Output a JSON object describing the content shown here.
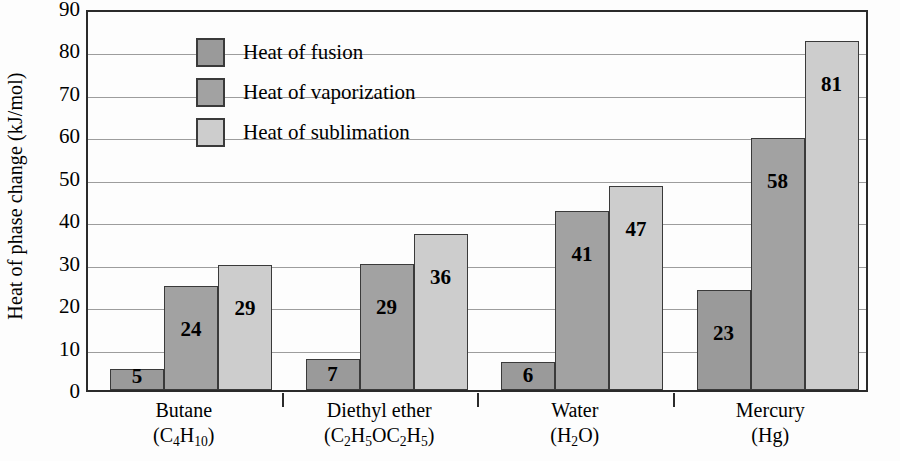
{
  "chart_data": {
    "type": "bar",
    "title": "",
    "xlabel": "",
    "ylabel": "Heat of phase change (kJ/mol)",
    "ylim": [
      0,
      90
    ],
    "ytick_step": 10,
    "yticks": [
      90,
      80,
      70,
      60,
      50,
      40,
      30,
      20,
      10,
      0
    ],
    "grid": true,
    "legend_position": "inside-top-left",
    "categories": [
      "Butane",
      "Diethyl ether",
      "Water",
      "Mercury"
    ],
    "category_formulas": [
      "(C4H10)",
      "(C2H5OC2H5)",
      "(H2O)",
      "(Hg)"
    ],
    "series": [
      {
        "name": "Heat of fusion",
        "color": "#9a9a9a",
        "values": [
          5,
          7,
          6,
          23
        ],
        "bar_tops": [
          5.0,
          7.3,
          6.7,
          23.6
        ],
        "labels": [
          "5",
          "7",
          "6",
          "23"
        ]
      },
      {
        "name": "Heat of vaporization",
        "color": "#a2a2a2",
        "values": [
          24,
          29,
          41,
          58
        ],
        "bar_tops": [
          24.4,
          29.6,
          42.1,
          59.4
        ],
        "labels": [
          "24",
          "29",
          "41",
          "58"
        ]
      },
      {
        "name": "Heat of sublimation",
        "color": "#cdcdcd",
        "values": [
          29,
          36,
          47,
          81
        ],
        "bar_tops": [
          29.5,
          36.8,
          48.0,
          82.2
        ],
        "labels": [
          "29",
          "36",
          "47",
          "81"
        ]
      }
    ]
  },
  "axis": {
    "y_title": "Heat of phase change (kJ/mol)",
    "y_tick_labels": [
      "90",
      "80",
      "70",
      "60",
      "50",
      "40",
      "30",
      "20",
      "10",
      "0"
    ]
  },
  "legend": {
    "items": [
      {
        "label": "Heat of fusion",
        "color": "#9a9a9a"
      },
      {
        "label": "Heat of vaporization",
        "color": "#a2a2a2"
      },
      {
        "label": "Heat of sublimation",
        "color": "#cdcdcd"
      }
    ]
  },
  "x_axis": {
    "groups": [
      {
        "name": "Butane",
        "formula_html": "(C<sub>4</sub>H<sub>10</sub>)"
      },
      {
        "name": "Diethyl ether",
        "formula_html": "(C<sub>2</sub>H<sub>5</sub>OC<sub>2</sub>H<sub>5</sub>)"
      },
      {
        "name": "Water",
        "formula_html": "(H<sub>2</sub>O)"
      },
      {
        "name": "Mercury",
        "formula_html": "(Hg)"
      }
    ]
  },
  "colors": {
    "axis_line": "#2b2b2b",
    "gridline": "#9d9d9d",
    "bar_border": "#3a3a3a",
    "background": "#fdfdfd",
    "text": "#000000"
  }
}
